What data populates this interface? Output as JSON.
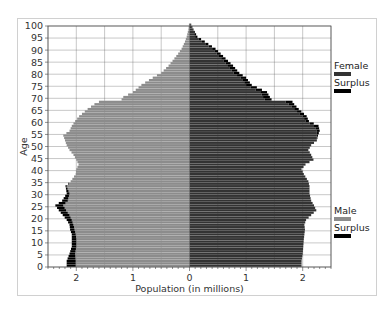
{
  "chart_data": {
    "type": "bar",
    "orientation": "horizontal",
    "title": "",
    "xlabel": "Population (in millions)",
    "ylabel": "Age",
    "xlim": [
      -2.5,
      2.5
    ],
    "ylim": [
      0,
      100
    ],
    "x_ticks": [
      -2,
      -1,
      0,
      1,
      2
    ],
    "x_tick_labels": [
      "2",
      "1",
      "0",
      "1",
      "2"
    ],
    "y_ticks": [
      0,
      5,
      10,
      15,
      20,
      25,
      30,
      35,
      40,
      45,
      50,
      55,
      60,
      65,
      70,
      75,
      80,
      85,
      90,
      95,
      100
    ],
    "grid": true,
    "legend": [
      {
        "label": "Female",
        "color": "#333333",
        "position": "upper right outside"
      },
      {
        "label": "Surplus",
        "color": "#000000",
        "position": "upper right outside"
      },
      {
        "label": "Male",
        "color": "#8c8c8c",
        "position": "lower right outside"
      },
      {
        "label": "Surplus",
        "color": "#000000",
        "position": "lower right outside"
      }
    ],
    "ages": [
      0,
      2,
      5,
      8,
      11,
      13,
      15,
      17,
      19,
      21,
      23,
      25,
      27,
      30,
      33,
      35,
      38,
      40,
      42,
      44,
      46,
      48,
      50,
      52,
      54,
      56,
      58,
      60,
      62,
      65,
      67,
      68,
      69,
      70,
      72,
      75,
      78,
      80,
      83,
      85,
      88,
      90,
      93,
      95,
      98,
      100
    ],
    "series": [
      {
        "name": "Male",
        "color": "#8c8c8c",
        "values": [
          2.01,
          2.01,
          2.02,
          2.0,
          2.0,
          2.01,
          2.03,
          2.05,
          2.08,
          2.12,
          2.18,
          2.23,
          2.15,
          2.12,
          2.17,
          2.1,
          2.01,
          2.0,
          1.96,
          2.0,
          2.05,
          2.12,
          2.17,
          2.2,
          2.23,
          2.12,
          2.08,
          2.02,
          1.95,
          1.8,
          1.68,
          1.6,
          1.2,
          1.17,
          1.0,
          0.85,
          0.65,
          0.5,
          0.37,
          0.3,
          0.2,
          0.14,
          0.08,
          0.05,
          0.02,
          0.01
        ]
      },
      {
        "name": "Male Surplus",
        "color": "#000000",
        "values": [
          0.16,
          0.16,
          0.1,
          0.08,
          0.08,
          0.07,
          0.08,
          0.07,
          0.09,
          0.12,
          0.13,
          0.14,
          0.1,
          0.05,
          0.02,
          0.0,
          0,
          0,
          0,
          0,
          0,
          0,
          0,
          0,
          0,
          0,
          0,
          0,
          0,
          0,
          0,
          0,
          0,
          0,
          0,
          0,
          0,
          0,
          0,
          0,
          0,
          0,
          0,
          0,
          0,
          0
        ]
      },
      {
        "name": "Female",
        "color": "#333333",
        "values": [
          1.98,
          1.98,
          2.0,
          2.01,
          2.02,
          2.03,
          2.04,
          2.03,
          2.06,
          2.15,
          2.24,
          2.2,
          2.15,
          2.12,
          2.12,
          2.1,
          2.02,
          1.98,
          2.05,
          2.19,
          2.15,
          2.1,
          2.15,
          2.25,
          2.25,
          2.25,
          2.2,
          2.05,
          2.0,
          1.85,
          1.75,
          1.7,
          1.33,
          1.3,
          1.25,
          1.0,
          0.9,
          0.78,
          0.68,
          0.6,
          0.48,
          0.4,
          0.22,
          0.1,
          0.05,
          0.02
        ]
      },
      {
        "name": "Female Surplus",
        "color": "#000000",
        "values": [
          0,
          0,
          0,
          0,
          0,
          0,
          0,
          0,
          0,
          0,
          0,
          0,
          0,
          0,
          0,
          0,
          0,
          0,
          0,
          0,
          0,
          0,
          0,
          0,
          0.02,
          0.05,
          0.08,
          0.06,
          0.07,
          0.08,
          0.1,
          0.12,
          0.12,
          0.12,
          0.12,
          0.1,
          0.1,
          0.1,
          0.09,
          0.08,
          0.07,
          0.06,
          0.05,
          0.04,
          0.02,
          0.01
        ]
      }
    ]
  }
}
